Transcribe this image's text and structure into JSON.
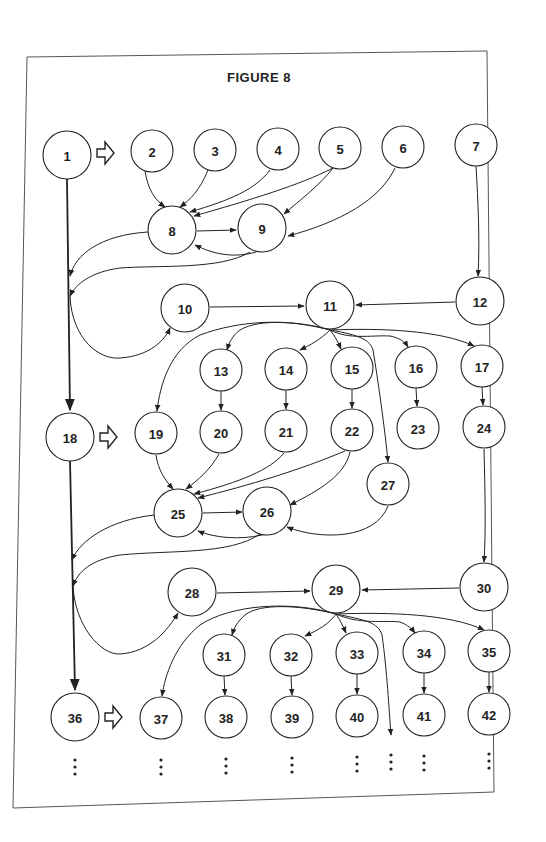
{
  "figure": {
    "title": "FIGURE 8",
    "colors": {
      "stroke": "#222222",
      "background": "#ffffff",
      "frame": "#555555"
    }
  },
  "nodes": [
    {
      "id": "1",
      "x": 67,
      "y": 155,
      "r": 24
    },
    {
      "id": "2",
      "x": 152,
      "y": 151,
      "r": 21
    },
    {
      "id": "3",
      "x": 215,
      "y": 150,
      "r": 21
    },
    {
      "id": "4",
      "x": 278,
      "y": 149,
      "r": 21
    },
    {
      "id": "5",
      "x": 340,
      "y": 148,
      "r": 21
    },
    {
      "id": "6",
      "x": 403,
      "y": 147,
      "r": 21
    },
    {
      "id": "7",
      "x": 476,
      "y": 145,
      "r": 21
    },
    {
      "id": "8",
      "x": 172,
      "y": 230,
      "r": 24
    },
    {
      "id": "9",
      "x": 262,
      "y": 228,
      "r": 24
    },
    {
      "id": "10",
      "x": 185,
      "y": 308,
      "r": 24
    },
    {
      "id": "11",
      "x": 330,
      "y": 305,
      "r": 24
    },
    {
      "id": "12",
      "x": 480,
      "y": 301,
      "r": 24
    },
    {
      "id": "13",
      "x": 221,
      "y": 370,
      "r": 21
    },
    {
      "id": "14",
      "x": 286,
      "y": 369,
      "r": 21
    },
    {
      "id": "15",
      "x": 352,
      "y": 368,
      "r": 21
    },
    {
      "id": "16",
      "x": 416,
      "y": 367,
      "r": 21
    },
    {
      "id": "17",
      "x": 482,
      "y": 366,
      "r": 21
    },
    {
      "id": "18",
      "x": 70,
      "y": 437,
      "r": 24
    },
    {
      "id": "19",
      "x": 156,
      "y": 433,
      "r": 21
    },
    {
      "id": "20",
      "x": 221,
      "y": 432,
      "r": 21
    },
    {
      "id": "21",
      "x": 286,
      "y": 431,
      "r": 21
    },
    {
      "id": "22",
      "x": 352,
      "y": 430,
      "r": 21
    },
    {
      "id": "23",
      "x": 418,
      "y": 428,
      "r": 21
    },
    {
      "id": "24",
      "x": 484,
      "y": 427,
      "r": 21
    },
    {
      "id": "25",
      "x": 178,
      "y": 513,
      "r": 24
    },
    {
      "id": "26",
      "x": 267,
      "y": 511,
      "r": 24
    },
    {
      "id": "27",
      "x": 388,
      "y": 484,
      "r": 21
    },
    {
      "id": "28",
      "x": 192,
      "y": 592,
      "r": 24
    },
    {
      "id": "29",
      "x": 336,
      "y": 589,
      "r": 24
    },
    {
      "id": "30",
      "x": 484,
      "y": 587,
      "r": 24
    },
    {
      "id": "31",
      "x": 224,
      "y": 655,
      "r": 21
    },
    {
      "id": "32",
      "x": 291,
      "y": 655,
      "r": 21
    },
    {
      "id": "33",
      "x": 357,
      "y": 653,
      "r": 21
    },
    {
      "id": "34",
      "x": 424,
      "y": 652,
      "r": 21
    },
    {
      "id": "35",
      "x": 489,
      "y": 651,
      "r": 21
    },
    {
      "id": "36",
      "x": 75,
      "y": 717,
      "r": 24
    },
    {
      "id": "37",
      "x": 161,
      "y": 718,
      "r": 21
    },
    {
      "id": "38",
      "x": 226,
      "y": 717,
      "r": 21
    },
    {
      "id": "39",
      "x": 292,
      "y": 717,
      "r": 21
    },
    {
      "id": "40",
      "x": 357,
      "y": 716,
      "r": 21
    },
    {
      "id": "41",
      "x": 424,
      "y": 715,
      "r": 21
    },
    {
      "id": "42",
      "x": 489,
      "y": 714,
      "r": 21
    }
  ],
  "edges": [
    {
      "from": "2",
      "to": "8"
    },
    {
      "from": "3",
      "to": "8"
    },
    {
      "from": "4",
      "to": "8"
    },
    {
      "from": "5",
      "to": "8"
    },
    {
      "from": "5",
      "to": "9"
    },
    {
      "from": "6",
      "to": "9"
    },
    {
      "from": "8",
      "to": "9"
    },
    {
      "from": "9",
      "to": "8"
    },
    {
      "from": "8",
      "to": "spine-1"
    },
    {
      "from": "9",
      "to": "spine-1"
    },
    {
      "from": "spine-1",
      "to": "10"
    },
    {
      "from": "10",
      "to": "11"
    },
    {
      "from": "7",
      "to": "12"
    },
    {
      "from": "12",
      "to": "11"
    },
    {
      "from": "11",
      "to": "13"
    },
    {
      "from": "11",
      "to": "14"
    },
    {
      "from": "11",
      "to": "15"
    },
    {
      "from": "11",
      "to": "16"
    },
    {
      "from": "11",
      "to": "17"
    },
    {
      "from": "11",
      "to": "19"
    },
    {
      "from": "11",
      "to": "27"
    },
    {
      "from": "1",
      "to": "18"
    },
    {
      "from": "13",
      "to": "20"
    },
    {
      "from": "14",
      "to": "21"
    },
    {
      "from": "15",
      "to": "22"
    },
    {
      "from": "16",
      "to": "23"
    },
    {
      "from": "17",
      "to": "24"
    },
    {
      "from": "19",
      "to": "25"
    },
    {
      "from": "20",
      "to": "25"
    },
    {
      "from": "21",
      "to": "25"
    },
    {
      "from": "22",
      "to": "25"
    },
    {
      "from": "22",
      "to": "26"
    },
    {
      "from": "25",
      "to": "26"
    },
    {
      "from": "26",
      "to": "25"
    },
    {
      "from": "27",
      "to": "26"
    },
    {
      "from": "25",
      "to": "spine-2"
    },
    {
      "from": "26",
      "to": "spine-2"
    },
    {
      "from": "spine-2",
      "to": "28"
    },
    {
      "from": "28",
      "to": "29"
    },
    {
      "from": "24",
      "to": "30"
    },
    {
      "from": "30",
      "to": "29"
    },
    {
      "from": "29",
      "to": "31"
    },
    {
      "from": "29",
      "to": "32"
    },
    {
      "from": "29",
      "to": "33"
    },
    {
      "from": "29",
      "to": "34"
    },
    {
      "from": "29",
      "to": "35"
    },
    {
      "from": "29",
      "to": "37"
    },
    {
      "from": "29",
      "to": "continuation"
    },
    {
      "from": "18",
      "to": "36"
    },
    {
      "from": "31",
      "to": "38"
    },
    {
      "from": "32",
      "to": "39"
    },
    {
      "from": "33",
      "to": "40"
    },
    {
      "from": "34",
      "to": "41"
    },
    {
      "from": "35",
      "to": "42"
    }
  ],
  "hollow_arrows": [
    {
      "after": "1",
      "x": 97,
      "y": 153
    },
    {
      "after": "18",
      "x": 100,
      "y": 437
    },
    {
      "after": "36",
      "x": 105,
      "y": 717
    }
  ],
  "ellipses": [
    {
      "below": "36",
      "x": 75,
      "y": 760
    },
    {
      "below": "37",
      "x": 161,
      "y": 760
    },
    {
      "below": "38",
      "x": 226,
      "y": 759
    },
    {
      "below": "39",
      "x": 292,
      "y": 758
    },
    {
      "below": "40",
      "x": 357,
      "y": 757
    },
    {
      "below": "continuation",
      "x": 391,
      "y": 755
    },
    {
      "below": "41",
      "x": 424,
      "y": 756
    },
    {
      "below": "42",
      "x": 489,
      "y": 754
    }
  ]
}
